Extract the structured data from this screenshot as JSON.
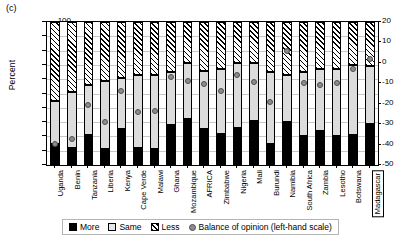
{
  "panel_label": "(c)",
  "axes": {
    "ylabel_left": "Percent",
    "yticks_left": [
      "0",
      "10",
      "20",
      "30",
      "40",
      "50",
      "60",
      "70",
      "80",
      "90",
      "100"
    ],
    "yticks_right": [
      "-50",
      "-40",
      "-30",
      "-20",
      "-10",
      "0",
      "10",
      "20"
    ],
    "ylim_left": [
      0,
      100
    ],
    "ylim_right": [
      -50,
      20
    ]
  },
  "legend": {
    "items": [
      {
        "label": "More",
        "swatch": "more",
        "icon": "black-square-icon"
      },
      {
        "label": "Same",
        "swatch": "same",
        "icon": "light-gray-square-icon"
      },
      {
        "label": "Less",
        "swatch": "less",
        "icon": "hatched-square-icon"
      },
      {
        "label": "Balance of opinion (left-hand scale)",
        "swatch": "dotsw",
        "icon": "gray-circle-icon"
      }
    ]
  },
  "chart_data": {
    "type": "bar",
    "title": "(c)",
    "subtitle": "",
    "xlabel": "",
    "ylabel": "Percent",
    "ylim": [
      0,
      100
    ],
    "ylim_secondary": [
      -50,
      20
    ],
    "grid": true,
    "stacked": true,
    "legend_position": "bottom",
    "categories": [
      "Uganda",
      "Benin",
      "Tanzania",
      "Liberia",
      "Kenya",
      "Cape Verde",
      "Malawi",
      "Ghana",
      "Mozambique",
      "AFRICA",
      "Zimbabwe",
      "Nigeria",
      "Mali",
      "Burundi",
      "Namibia",
      "South Africa",
      "Zambia",
      "Lesotho",
      "Botswana",
      "Madagascar"
    ],
    "highlighted_category": "Madagascar",
    "series": [
      {
        "name": "More",
        "axis": "left",
        "values": [
          15,
          12,
          21,
          11,
          25,
          12,
          11,
          28,
          32,
          25,
          22,
          26,
          31,
          15,
          30,
          20,
          24,
          20,
          21,
          29
        ]
      },
      {
        "name": "Same",
        "axis": "left",
        "values": [
          30,
          39,
          35,
          48,
          36,
          51,
          52,
          37,
          39,
          41,
          45,
          45,
          40,
          50,
          33,
          45,
          43,
          47,
          49,
          40
        ]
      },
      {
        "name": "Less",
        "axis": "left",
        "values": [
          55,
          49,
          44,
          41,
          39,
          37,
          37,
          35,
          29,
          34,
          33,
          29,
          29,
          35,
          37,
          35,
          33,
          33,
          30,
          31
        ]
      }
    ],
    "balance_of_opinion": {
      "name": "Balance of opinion (left-hand scale)",
      "axis": "right",
      "unit": "percentage points",
      "values": [
        -35,
        -32,
        -20,
        -36,
        -15,
        -24,
        -24,
        -7,
        -5,
        -11,
        -16,
        -4,
        -9,
        -22,
        16,
        -6,
        -7,
        -6,
        2,
        11
      ]
    },
    "balance_plot_left_axis_positions": [
      15,
      18.5,
      42,
      30,
      51.5,
      37,
      38,
      61.5,
      59,
      56.5,
      52,
      63,
      58,
      44,
      80,
      57,
      56,
      57,
      67,
      74
    ]
  }
}
